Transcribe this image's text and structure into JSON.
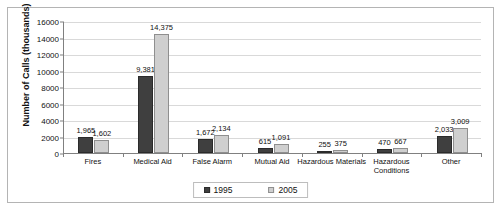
{
  "chart_data": {
    "type": "bar",
    "title": "",
    "xlabel": "",
    "ylabel": "Number of Calls (thousands)",
    "ylim": [
      0,
      16000
    ],
    "ytick_values": [
      0,
      2000,
      4000,
      6000,
      8000,
      10000,
      12000,
      14000,
      16000
    ],
    "ytick_labels": [
      "0",
      "2000",
      "4000",
      "6000",
      "8000",
      "10000",
      "12000",
      "14000",
      "16000"
    ],
    "grid": true,
    "legend_position": "bottom",
    "categories": [
      "Fires",
      "Medical Aid",
      "False Alarm",
      "Mutual Aid",
      "Hazardous Materials",
      "Hazardous Conditions",
      "Other"
    ],
    "series": [
      {
        "name": "1995",
        "color": "#3f3f3f",
        "values": [
          1965,
          9381,
          1672,
          615,
          255,
          470,
          2033
        ],
        "labels": [
          "1,965",
          "9,381",
          "1,672",
          "615",
          "255",
          "470",
          "2,033"
        ]
      },
      {
        "name": "2005",
        "color": "#cfcfcf",
        "values": [
          1602,
          14375,
          2134,
          1091,
          375,
          667,
          3009
        ],
        "labels": [
          "1,602",
          "14,375",
          "2,134",
          "1,091",
          "375",
          "667",
          "3,009"
        ]
      }
    ]
  },
  "legend": {
    "items": [
      {
        "label": "1995"
      },
      {
        "label": "2005"
      }
    ]
  }
}
